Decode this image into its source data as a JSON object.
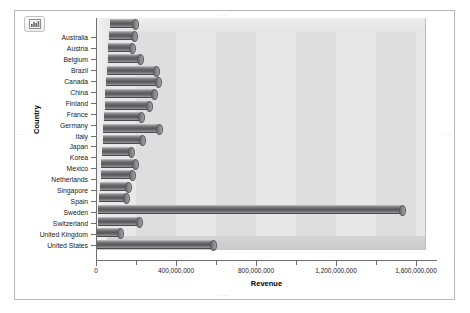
{
  "chart_data": {
    "type": "bar",
    "orientation": "horizontal",
    "title": "",
    "xlabel": "Revenue",
    "ylabel": "Country",
    "xlim": [
      0,
      1650000000
    ],
    "grid": false,
    "legend": null,
    "x_ticks": [
      {
        "value": 0,
        "label": "0",
        "major": true
      },
      {
        "value": 200000000,
        "label": "",
        "major": false
      },
      {
        "value": 400000000,
        "label": "400,000,000",
        "major": true
      },
      {
        "value": 600000000,
        "label": "",
        "major": false
      },
      {
        "value": 800000000,
        "label": "800,000,000",
        "major": true
      },
      {
        "value": 1000000000,
        "label": "",
        "major": false
      },
      {
        "value": 1200000000,
        "label": "1,200,000,000",
        "major": true
      },
      {
        "value": 1400000000,
        "label": "",
        "major": false
      },
      {
        "value": 1600000000,
        "label": "1,600,000,000",
        "major": true
      }
    ],
    "categories": [
      "Australia",
      "Austria",
      "Belgium",
      "Brazil",
      "Canada",
      "China",
      "Finland",
      "France",
      "Germany",
      "Italy",
      "Japan",
      "Korea",
      "Mexico",
      "Netherlands",
      "Singapore",
      "Spain",
      "Sweden",
      "Switzerland",
      "United Kingdom",
      "United States"
    ],
    "values": [
      130000000,
      130000000,
      125000000,
      165000000,
      250000000,
      265000000,
      250000000,
      225000000,
      190000000,
      285000000,
      200000000,
      150000000,
      175000000,
      160000000,
      145000000,
      140000000,
      1525000000,
      210000000,
      120000000,
      590000000
    ]
  },
  "toolbar": {
    "chart_icon_name": "chart-tool-icon"
  }
}
